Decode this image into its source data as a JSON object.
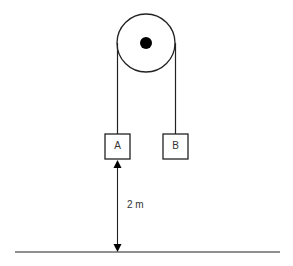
{
  "diagram": {
    "type": "atwood-machine",
    "pulley": {
      "center": [
        146,
        43
      ],
      "radius": 29,
      "axle_radius": 6,
      "stroke_color": "#222222",
      "axle_color": "#000000"
    },
    "blocks": [
      {
        "label": "A",
        "x": 105,
        "y": 134,
        "size": 25
      },
      {
        "label": "B",
        "x": 163,
        "y": 134,
        "size": 25
      }
    ],
    "ropes": [
      {
        "x": 118,
        "y1": 43,
        "y2": 134
      },
      {
        "x": 176,
        "y1": 43,
        "y2": 134
      }
    ],
    "ground": {
      "x1": 15,
      "x2": 280,
      "y": 252
    },
    "height_indicator": {
      "label": "2 m",
      "x": 118,
      "y_top": 159,
      "y_bottom": 252,
      "label_pos": [
        127,
        205
      ]
    },
    "line_color": "#222222",
    "text_color": "#333333"
  }
}
